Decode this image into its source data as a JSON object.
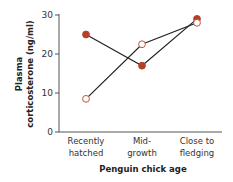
{
  "chart_data": {
    "type": "line",
    "title": "",
    "xlabel": "Penguin chick age",
    "ylabel_line1": "Plasma",
    "ylabel_line2": "corticosterone (ng/ml)",
    "ylabel": "Plasma corticosterone (ng/ml)",
    "ylim": [
      0,
      30
    ],
    "yticks": [
      "0",
      "10",
      "20",
      "30"
    ],
    "categories": [
      "Recently hatched",
      "Mid-growth",
      "Close to fledging"
    ],
    "category_lines": [
      [
        "Recently",
        "hatched"
      ],
      [
        "Mid-",
        "growth"
      ],
      [
        "Close to",
        "fledging"
      ]
    ],
    "grid": false,
    "legend": null,
    "series": [
      {
        "name": "Filled markers",
        "marker": "filled",
        "color": "#b5402a",
        "values": [
          25,
          17,
          29
        ]
      },
      {
        "name": "Open markers",
        "marker": "open",
        "color": "#c0553a",
        "values": [
          8.5,
          22.5,
          28
        ]
      }
    ]
  }
}
